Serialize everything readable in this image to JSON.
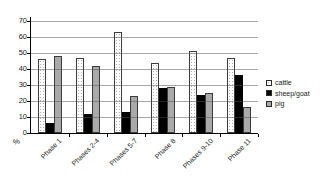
{
  "chart_data": {
    "type": "bar",
    "title": "",
    "categories": [
      "Phase 1",
      "Phases 2-4",
      "Phases 5-7",
      "Phase 8",
      "Phases 9-10",
      "Phase 11"
    ],
    "series": [
      {
        "name": "cattle",
        "values": [
          46,
          47,
          63,
          44,
          51,
          47
        ],
        "fill": "#ffffff",
        "pattern": "dots",
        "border": true
      },
      {
        "name": "sheep/goat",
        "values": [
          6,
          12,
          13,
          28,
          24,
          36
        ],
        "fill": "#000000",
        "pattern": "solid",
        "border": false
      },
      {
        "name": "pig",
        "values": [
          48,
          42,
          23,
          29,
          25,
          16
        ],
        "fill": "#a9a9a9",
        "pattern": "solid",
        "border": true
      }
    ],
    "ylim": [
      0,
      70
    ],
    "yticks": [
      0,
      10,
      20,
      30,
      40,
      50,
      60,
      70
    ],
    "y_unit_label": "%",
    "grid": true,
    "legend_position": "right",
    "legend_entries": [
      "cattle",
      "sheep/goat",
      "pig"
    ]
  },
  "colors": {
    "background": "#ffffff",
    "axis": "#000000",
    "gridline": "#8c8c8c",
    "text": "#1a1a1a",
    "cattle_fill": "#ffffff",
    "sheep_goat_fill": "#000000",
    "pig_fill": "#a9a9a9"
  }
}
